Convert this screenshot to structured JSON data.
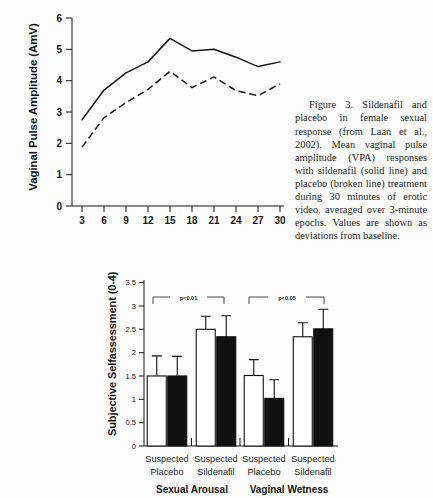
{
  "caption": {
    "text": "Figure 3. Sildenafil and placebo in female sexual response (from Laan et al., 2002). Mean vaginal pulse amplitude (VPA) responses with sildenafil (solid line) and placebo (broken line) treatment during 30 minutes of erotic video, averaged over 3-minute epochs. Values are shown as deviations from baseline."
  },
  "chart_data": [
    {
      "type": "line",
      "id": "vpa-line-chart",
      "title": "",
      "xlabel": "",
      "ylabel": "Vaginal Pulse Amplitude (AmV)",
      "xlim": [
        1.5,
        31.5
      ],
      "ylim": [
        0,
        6
      ],
      "grid": false,
      "legend_position": "none",
      "xticks": [
        3,
        6,
        9,
        12,
        15,
        18,
        21,
        24,
        27,
        30
      ],
      "xtick_labels": [
        "3",
        "6",
        "9",
        "12",
        "15",
        "18",
        "21",
        "24",
        "27",
        "30"
      ],
      "yticks": [
        0,
        1,
        2,
        3,
        4,
        5,
        6
      ],
      "ytick_labels": [
        "0",
        "1",
        "2",
        "3",
        "4",
        "5",
        "6"
      ],
      "x": [
        3,
        6,
        9,
        12,
        15,
        18,
        21,
        24,
        27,
        30
      ],
      "series": [
        {
          "name": "sildenafil (solid line)",
          "style": "solid",
          "values": [
            2.75,
            3.7,
            4.25,
            4.6,
            5.35,
            4.95,
            5.0,
            4.75,
            4.45,
            4.6
          ]
        },
        {
          "name": "placebo (broken line)",
          "style": "dashed",
          "values": [
            1.88,
            2.82,
            3.3,
            3.72,
            4.3,
            3.78,
            4.12,
            3.68,
            3.52,
            3.9
          ]
        }
      ]
    },
    {
      "type": "bar",
      "id": "subjective-selfassessment-bar-chart",
      "title": "",
      "xlabel": "",
      "ylabel": "Subjective Selfassessment (0-4)",
      "ylim": [
        0,
        3.6
      ],
      "grid": false,
      "legend_position": "none",
      "yticks": [
        0,
        0.5,
        1,
        1.5,
        2,
        2.5,
        3,
        3.5
      ],
      "ytick_labels": [
        "0",
        "0.5",
        "1",
        "1.5",
        "2",
        "2.5",
        "3",
        "3.5"
      ],
      "categories": [
        "Suspected Placebo",
        "Suspected Sildenafil",
        "Suspected Placebo",
        "Suspected Sildenafil"
      ],
      "category_lines": [
        [
          "Suspected",
          "Placebo"
        ],
        [
          "Suspected",
          "Sildenafil"
        ],
        [
          "Suspected",
          "Placebo"
        ],
        [
          "Suspected",
          "Sildenafil"
        ]
      ],
      "groups": [
        {
          "label": "Sexual Arousal",
          "categories": [
            0,
            1
          ]
        },
        {
          "label": "Vaginal Wetness",
          "categories": [
            2,
            3
          ]
        }
      ],
      "series": [
        {
          "name": "open bar",
          "fill": "open",
          "values": [
            1.5,
            2.5,
            1.51,
            2.34
          ],
          "errors": [
            0.43,
            0.28,
            0.34,
            0.3
          ]
        },
        {
          "name": "filled bar",
          "fill": "filled",
          "values": [
            1.5,
            2.34,
            1.02,
            2.51
          ],
          "errors": [
            0.42,
            0.45,
            0.4,
            0.42
          ]
        }
      ],
      "annotations": [
        {
          "text": "p<0.01",
          "between": [
            0,
            1
          ]
        },
        {
          "text": "p<0.05",
          "between": [
            2,
            3
          ]
        }
      ]
    }
  ]
}
